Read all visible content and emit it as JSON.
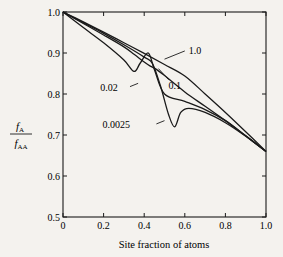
{
  "chart_data": {
    "type": "line",
    "title": "",
    "xlabel": "Site fraction of atoms",
    "ylabel": "fA / fAA",
    "ylabel_num": "f",
    "ylabel_num_sub": "A",
    "ylabel_den": "f",
    "ylabel_den_sub": "AA",
    "xlim": [
      0,
      1.0
    ],
    "ylim": [
      0.5,
      1.0
    ],
    "xticks": [
      "0",
      "0.2",
      "0.4",
      "0.6",
      "0.8",
      "1.0"
    ],
    "yticks": [
      "0.5",
      "0.6",
      "0.7",
      "0.8",
      "0.9",
      "1.0"
    ],
    "grid": false,
    "legend": "inline labels",
    "series": [
      {
        "name": "1.0",
        "x": [
          0,
          0.1,
          0.2,
          0.3,
          0.4,
          0.5,
          0.6,
          0.7,
          0.8,
          0.9,
          1.0
        ],
        "values": [
          1.0,
          0.976,
          0.951,
          0.925,
          0.899,
          0.872,
          0.844,
          0.8,
          0.755,
          0.708,
          0.66
        ]
      },
      {
        "name": "0.1",
        "x": [
          0,
          0.1,
          0.2,
          0.3,
          0.35,
          0.4,
          0.43,
          0.46,
          0.5,
          0.6,
          0.7,
          0.8,
          0.9,
          1.0
        ],
        "values": [
          1.0,
          0.972,
          0.944,
          0.915,
          0.897,
          0.878,
          0.868,
          0.86,
          0.845,
          0.805,
          0.77,
          0.735,
          0.698,
          0.66
        ]
      },
      {
        "name": "0.02",
        "x": [
          0,
          0.1,
          0.2,
          0.3,
          0.35,
          0.38,
          0.42,
          0.45,
          0.5,
          0.6,
          0.7,
          0.8,
          0.9,
          1.0
        ],
        "values": [
          1.0,
          0.962,
          0.925,
          0.883,
          0.855,
          0.875,
          0.9,
          0.86,
          0.8,
          0.782,
          0.762,
          0.735,
          0.698,
          0.66
        ]
      },
      {
        "name": "0.0025",
        "x": [
          0,
          0.1,
          0.2,
          0.3,
          0.4,
          0.44,
          0.48,
          0.52,
          0.55,
          0.58,
          0.62,
          0.7,
          0.8,
          0.9,
          1.0
        ],
        "values": [
          1.0,
          0.974,
          0.948,
          0.92,
          0.89,
          0.875,
          0.82,
          0.75,
          0.72,
          0.755,
          0.765,
          0.755,
          0.73,
          0.697,
          0.66
        ]
      }
    ],
    "annotations": [
      {
        "text": "1.0",
        "x": 0.62,
        "y": 0.905
      },
      {
        "text": "0.1",
        "x": 0.52,
        "y": 0.82
      },
      {
        "text": "0.02",
        "x": 0.27,
        "y": 0.815
      },
      {
        "text": "0.0025",
        "x": 0.33,
        "y": 0.725
      }
    ]
  }
}
